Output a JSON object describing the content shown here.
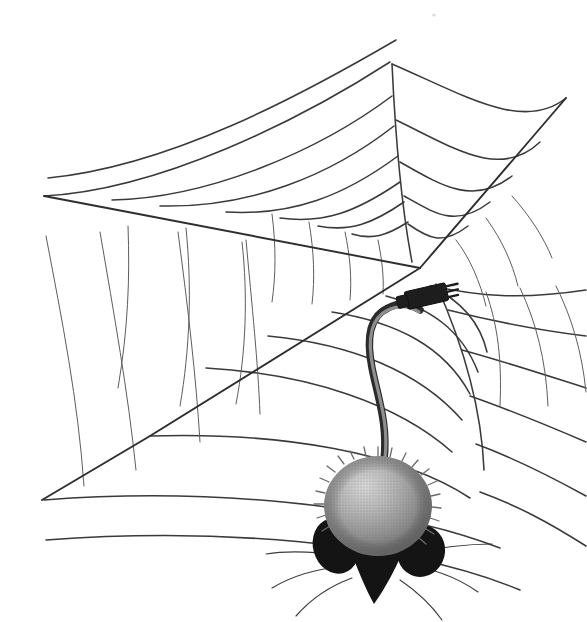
{
  "illustration": {
    "title": "Computer mouse caught in a spider web",
    "subject": "computer-mouse",
    "setting": "spider-web",
    "style": "black-and-white line drawing with halftone shading",
    "background_color": "#ffffff",
    "line_color": "#3a3a3a",
    "caption": ""
  },
  "palette": {
    "background": "#ffffff",
    "web_line": "#3a3a3a",
    "web_line_fine": "#5d5d5d",
    "web_radial": "#2e2e2e",
    "mouse_dark": "#141414",
    "mouse_body_light": "#c9c9c9",
    "mouse_body_mid": "#9a9a9a",
    "mouse_body_dark": "#6e6e6e",
    "cable_outer": "#2b2b2b",
    "cable_inner": "#8e8e8e",
    "connector": "#1d1d1d"
  },
  "web": {
    "hub": {
      "x": 420,
      "y": 268
    },
    "radials": [
      {
        "name": "radial-upper-left",
        "path": "M 420 268 L 128 212 L 44 196"
      },
      {
        "name": "radial-left-lower",
        "path": "M 420 268 L 150 436 L 42 500"
      },
      {
        "name": "radial-upper-right",
        "path": "M 420 268 L 530 140 L 566 98"
      },
      {
        "name": "radial-up-center",
        "path": "M 412 262 C 402 210 396 150 392 64"
      },
      {
        "name": "radial-down-right",
        "path": "M 436 284 C 470 360 482 420 484 470"
      }
    ],
    "spoke_stubs": [
      {
        "name": "spoke-stub-a",
        "path": "M 272 214 C 276 246 276 274 272 302"
      },
      {
        "name": "spoke-stub-b",
        "path": "M 309 222 C 314 252 315 278 312 304"
      },
      {
        "name": "spoke-stub-c",
        "path": "M 345 232 C 350 256 352 278 350 300"
      },
      {
        "name": "spoke-stub-d",
        "path": "M 378 240 C 382 260 384 276 383 294"
      },
      {
        "name": "spoke-stub-e",
        "path": "M 456 240 C 470 258 480 282 486 306"
      },
      {
        "name": "spoke-stub-f",
        "path": "M 486 218 C 502 240 512 262 518 286"
      },
      {
        "name": "spoke-stub-g",
        "path": "M 512 196 C 530 216 544 238 552 258"
      },
      {
        "name": "spoke-stub-h",
        "path": "M 128 226 C 130 278 128 330 118 388"
      },
      {
        "name": "spoke-stub-i",
        "path": "M 186 228 C 192 288 190 348 180 406"
      },
      {
        "name": "spoke-stub-j",
        "path": "M 242 242 C 248 296 246 352 236 404"
      }
    ],
    "spiral_arcs_upper": [
      {
        "name": "arc-upper-1",
        "path": "M 44 196 C 160 190 300 120 390 62"
      },
      {
        "name": "arc-upper-2",
        "path": "M 48 178 C 170 166 300 96 396 40"
      },
      {
        "name": "arc-upper-3",
        "path": "M 112 200 C 210 198 320 150 392 96"
      },
      {
        "name": "arc-upper-4",
        "path": "M 160 206 C 250 208 330 176 394 126"
      },
      {
        "name": "arc-upper-5",
        "path": "M 226 212 C 292 216 344 196 398 156"
      },
      {
        "name": "arc-upper-6",
        "path": "M 280 218 C 324 224 356 212 400 182"
      },
      {
        "name": "arc-upper-7",
        "path": "M 318 226 C 350 232 372 224 404 202"
      },
      {
        "name": "arc-upper-8",
        "path": "M 352 234 C 372 240 386 236 408 222"
      }
    ],
    "spiral_arcs_right": [
      {
        "name": "arc-right-1",
        "path": "M 392 64 C 466 96 524 132 566 98"
      },
      {
        "name": "arc-right-2",
        "path": "M 396 120 C 454 148 500 180 540 142"
      },
      {
        "name": "arc-right-3",
        "path": "M 400 162 C 442 186 474 206 512 176"
      },
      {
        "name": "arc-right-4",
        "path": "M 404 196 C 436 214 456 228 490 202"
      },
      {
        "name": "arc-right-5",
        "path": "M 408 224 C 428 238 442 246 468 226"
      }
    ],
    "spiral_arcs_lower": [
      {
        "name": "arc-lower-1",
        "path": "M 430 286 C 460 300 480 322 487 352"
      },
      {
        "name": "arc-lower-2",
        "path": "M 386 296 C 430 308 462 330 478 372"
      },
      {
        "name": "arc-lower-3",
        "path": "M 332 312 C 396 322 444 346 470 394"
      },
      {
        "name": "arc-lower-4",
        "path": "M 268 336 C 352 344 420 372 462 420"
      },
      {
        "name": "arc-lower-5",
        "path": "M 206 368 C 310 374 398 404 452 452"
      },
      {
        "name": "arc-lower-6",
        "path": "M 150 436 C 280 432 400 452 470 498"
      },
      {
        "name": "arc-lower-7",
        "path": "M 44 500 C 200 488 380 502 500 548"
      },
      {
        "name": "arc-lower-8",
        "path": "M 46 540 C 210 528 400 540 520 590"
      }
    ],
    "spiral_arcs_right_lower": [
      {
        "name": "arc-rl-1",
        "path": "M 432 286 C 478 296 520 300 586 290"
      },
      {
        "name": "arc-rl-2",
        "path": "M 448 310 C 496 322 536 330 586 336"
      },
      {
        "name": "arc-rl-3",
        "path": "M 462 350 C 506 362 542 374 586 388"
      },
      {
        "name": "arc-rl-4",
        "path": "M 470 396 C 510 410 544 424 586 442"
      },
      {
        "name": "arc-rl-5",
        "path": "M 476 444 C 514 458 546 474 586 496"
      },
      {
        "name": "arc-rl-6",
        "path": "M 480 492 C 518 506 548 522 586 546"
      }
    ],
    "spiral_arcs_right_spokes": [
      {
        "name": "rl-spoke-1",
        "path": "M 486 292 C 498 326 502 360 500 406"
      },
      {
        "name": "rl-spoke-2",
        "path": "M 520 288 C 536 322 546 360 548 406"
      },
      {
        "name": "rl-spoke-3",
        "path": "M 556 286 C 572 318 582 352 586 392"
      }
    ],
    "left_fine_spokes": [
      {
        "name": "left-fine-1",
        "path": "M 46 236 C 62 320 78 400 84 486"
      },
      {
        "name": "left-fine-2",
        "path": "M 100 232 C 114 314 128 392 136 470"
      },
      {
        "name": "left-fine-3",
        "path": "M 178 232 C 188 308 196 376 200 442"
      },
      {
        "name": "left-fine-4",
        "path": "M 246 240 C 252 306 258 362 260 414"
      }
    ]
  },
  "mouse": {
    "name": "computer-mouse-as-rodent",
    "body": {
      "cx": 378,
      "cy": 506,
      "rx": 54,
      "ry": 50
    },
    "ear_left": {
      "cx": 336,
      "cy": 546,
      "rx": 23,
      "ry": 28
    },
    "ear_right": {
      "cx": 420,
      "cy": 550,
      "rx": 23,
      "ry": 26
    },
    "snout_path": "M 345 536 C 356 566 366 590 374 604 C 384 590 398 566 408 538 C 392 548 362 548 345 536 Z",
    "whiskers": [
      {
        "name": "whisker-left-1",
        "path": "M 346 556 C 318 552 290 550 266 554"
      },
      {
        "name": "whisker-left-2",
        "path": "M 348 566 C 320 568 292 576 272 588"
      },
      {
        "name": "whisker-left-3",
        "path": "M 352 578 C 330 586 310 600 296 616"
      },
      {
        "name": "whisker-right-1",
        "path": "M 408 554 C 436 548 466 544 492 544"
      },
      {
        "name": "whisker-right-2",
        "path": "M 406 566 C 432 568 458 578 478 592"
      },
      {
        "name": "whisker-right-3",
        "path": "M 400 580 C 418 592 432 606 442 620"
      }
    ],
    "fur_spikes": 34
  },
  "cable": {
    "name": "mouse-cable",
    "path": "M 384 460 C 388 424 378 398 372 368 C 366 338 370 316 388 308 C 404 300 414 306 420 310",
    "connector": {
      "name": "cable-connector-plug",
      "body_x": 404,
      "body_y": 292,
      "body_w": 42,
      "body_h": 18,
      "rotation": -13,
      "pins": 3
    }
  },
  "artifacts": [
    {
      "name": "scan-speck",
      "x": 434,
      "y": 15,
      "r": 1.6
    }
  ]
}
